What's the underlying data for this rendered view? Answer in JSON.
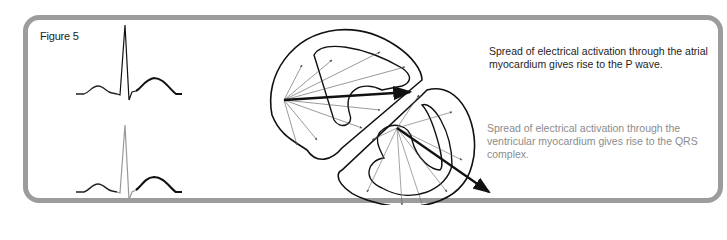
{
  "figure": {
    "label": "Figure 5",
    "border_color": "#9c9c9c"
  },
  "ecg_traces": [
    {
      "name": "ecg-trace-p-wave-highlight",
      "emphasis": "P wave (atrial)"
    },
    {
      "name": "ecg-trace-qrs-highlight",
      "emphasis": "QRS complex (ventricular)"
    }
  ],
  "heart_diagram": {
    "description": "Heart cross-section with activation vectors: atrial vectors fan from upper-left node; ventricular vectors fan from septal node; bold resultant arrows."
  },
  "captions": [
    {
      "text": "Spread of electrical activation through the atrial myocardium gives rise to the P wave.",
      "color": "#1e1e1e"
    },
    {
      "text": "Spread of electrical activation through the ventricular myocardium gives rise to the QRS complex.",
      "color": "#8c8c8c"
    }
  ]
}
